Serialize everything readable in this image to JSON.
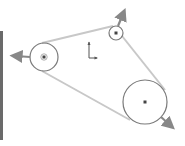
{
  "diagram": {
    "type": "belt-pulley-sketch",
    "colors": {
      "background": "#ffffff",
      "belt": "#c8c8c8",
      "pulley_outline": "#7a7a7a",
      "center_point": "#444444",
      "arrow": "#888888",
      "origin": "#555555",
      "left_bar": "#6a6a6a"
    },
    "pulleys": [
      {
        "id": "left",
        "cx": 44,
        "cy": 57,
        "r": 14,
        "arrow_direction": "left"
      },
      {
        "id": "top-small",
        "cx": 116,
        "cy": 33,
        "r": 7,
        "arrow_direction": "up-right"
      },
      {
        "id": "bottom-large",
        "cx": 145,
        "cy": 102,
        "r": 22,
        "arrow_direction": "down-right"
      }
    ],
    "belt_segments": [
      {
        "x1": 42,
        "y1": 43,
        "x2": 113,
        "y2": 26
      },
      {
        "x1": 122,
        "y1": 36,
        "x2": 165,
        "y2": 90
      },
      {
        "x1": 42,
        "y1": 71,
        "x2": 130,
        "y2": 120
      }
    ],
    "icons": {
      "origin": "origin-axes-icon",
      "arrows": "direction-arrow-icon"
    }
  }
}
